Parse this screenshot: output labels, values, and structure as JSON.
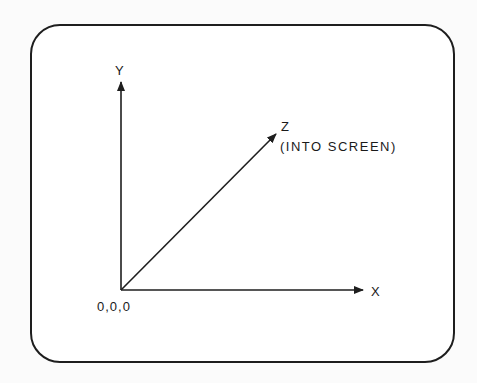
{
  "diagram": {
    "frame": {
      "shape": "rounded-rectangle",
      "stroke": "#1e1e1e"
    },
    "origin": {
      "label": "0,0,0"
    },
    "axes": [
      {
        "id": "x",
        "label": "X",
        "direction": "right"
      },
      {
        "id": "y",
        "label": "Y",
        "direction": "up"
      },
      {
        "id": "z",
        "label": "Z",
        "sublabel": "(INTO SCREEN)",
        "direction": "diagonal-up-right"
      }
    ],
    "colors": {
      "line": "#1e1e1e",
      "text": "#1a1a1a",
      "background": "#ffffff"
    }
  }
}
